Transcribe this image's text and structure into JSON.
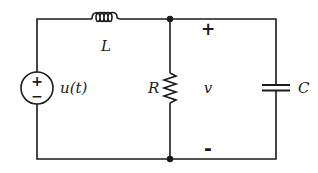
{
  "diagram": {
    "type": "circuit-schematic",
    "components": [
      {
        "id": "source",
        "kind": "voltage-source",
        "label": "u(t)",
        "polarity_top": "+",
        "polarity_bottom": "−"
      },
      {
        "id": "inductor",
        "kind": "inductor",
        "label": "L"
      },
      {
        "id": "resistor",
        "kind": "resistor",
        "label": "R"
      },
      {
        "id": "capacitor",
        "kind": "capacitor",
        "label": "C"
      }
    ],
    "voltage_label": {
      "name": "v",
      "plus": "+",
      "minus": "-"
    },
    "nodes": [
      "top-junction",
      "bottom-junction"
    ],
    "colors": {
      "stroke": "#1a1a1a",
      "background": "#ffffff"
    }
  }
}
